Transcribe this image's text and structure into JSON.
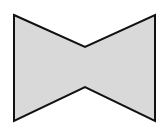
{
  "diagram": {
    "shape": "bowtie",
    "fill_color": "#d9d9d9",
    "stroke_color": "#111111",
    "stroke_width": 2,
    "points": [
      [
        14,
        15
      ],
      [
        85,
        47
      ],
      [
        155,
        15
      ],
      [
        155,
        121
      ],
      [
        85,
        87
      ],
      [
        14,
        121
      ]
    ]
  }
}
